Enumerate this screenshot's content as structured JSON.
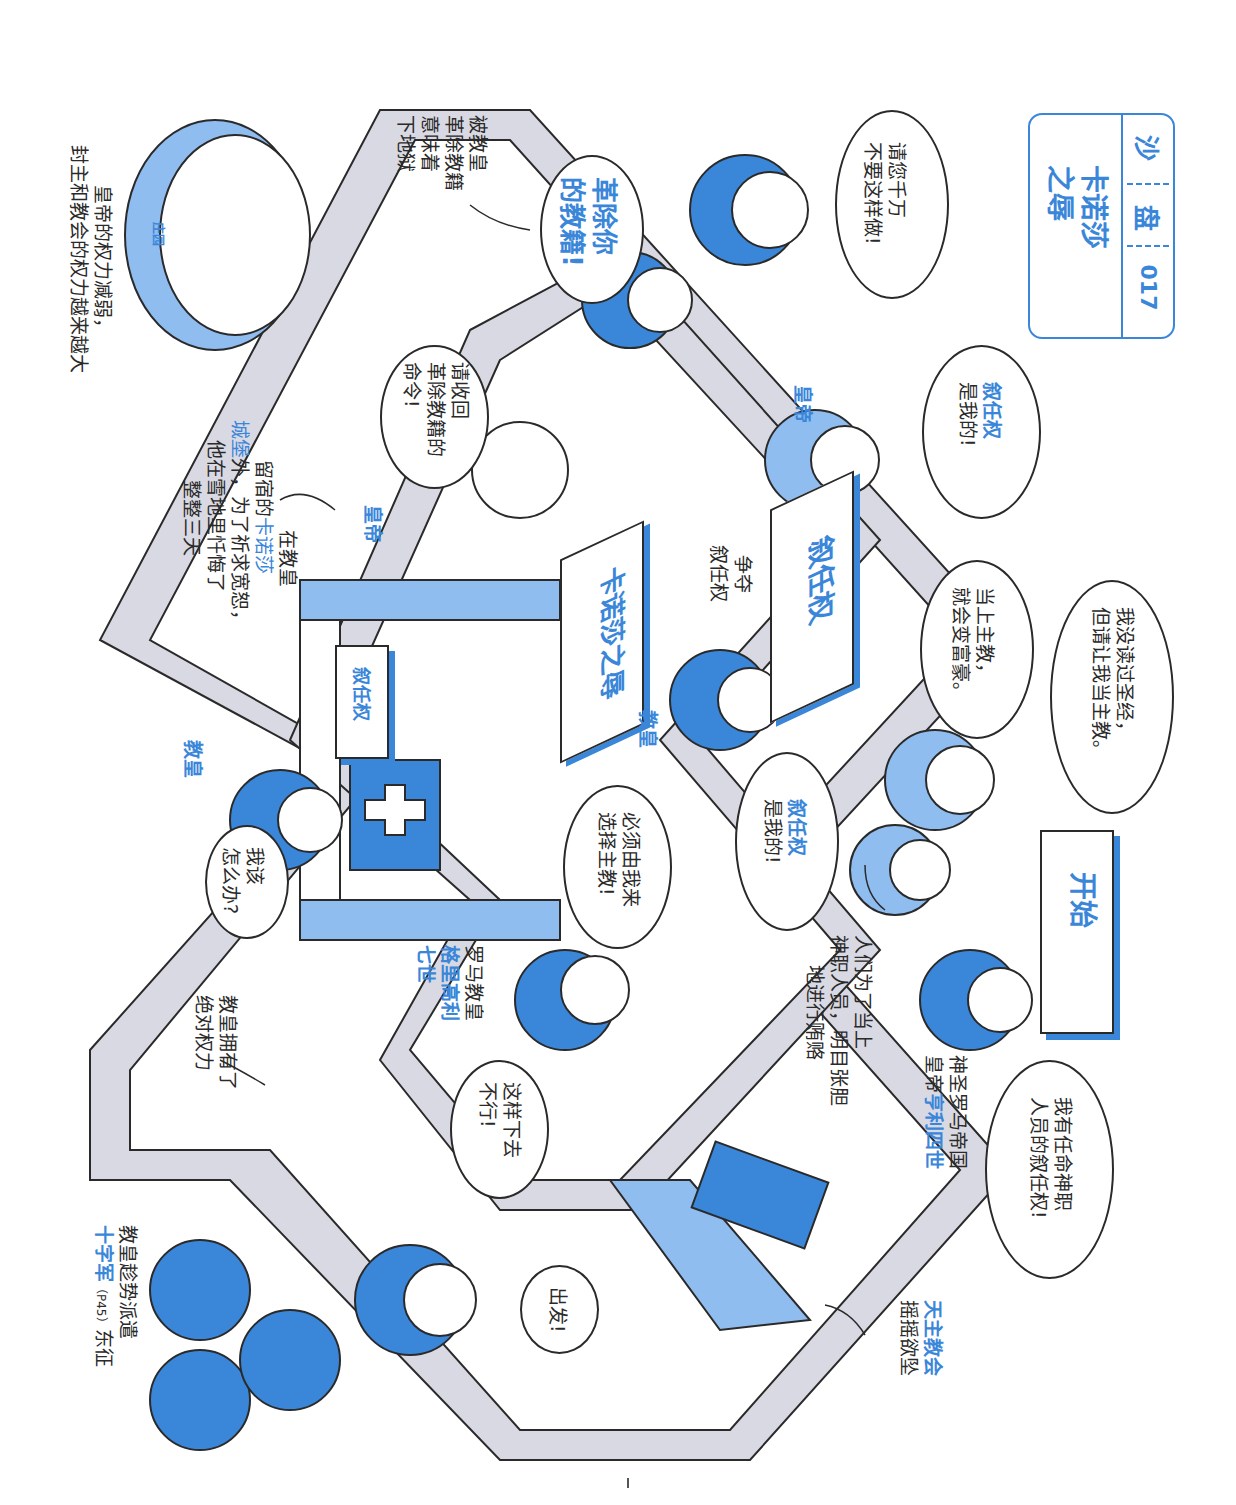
{
  "title_box": {
    "series_label_chars": [
      "沙",
      "盘",
      "017"
    ],
    "title_line1": "卡诺莎",
    "title_line2": "之辱"
  },
  "colors": {
    "accent_blue": "#3a86d9",
    "light_blue": "#8fbdf0",
    "path_gray": "#d9d9e3",
    "outline": "#2a2a2a"
  },
  "signs": {
    "start": "开始",
    "investiture_center": "叙任权",
    "canossa": "卡诺莎之辱",
    "investiture_castle": "叙任权",
    "manor": "庄园"
  },
  "speech_bubbles": {
    "dont_do_this": [
      "请您千万",
      "不要这样做!"
    ],
    "excommunicate": [
      "革除你",
      "的教籍!"
    ],
    "revoke_order": [
      "请收回",
      "革除教籍的",
      "命令!"
    ],
    "emperor_investiture": [
      "叙任权",
      "是我的!"
    ],
    "no_bible": [
      "我没读过圣经，",
      "但请让我当主教。"
    ],
    "become_rich": [
      "当上主教，",
      "就会变富豪。"
    ],
    "pope_investiture": [
      "叙任权",
      "是我的!"
    ],
    "must_choose": [
      "必须由我来",
      "选择主教!"
    ],
    "what_to_do": [
      "我该",
      "怎么办?"
    ],
    "cannot_continue": [
      "这样下去",
      "不行!"
    ],
    "depart": [
      "出发!"
    ],
    "appoint_clergy": [
      "我有任命神职",
      "人员的叙任权!"
    ]
  },
  "captions": {
    "excommunication_note": [
      "被教皇",
      "革除教籍",
      "意味着",
      "下地狱"
    ],
    "power_shift": [
      "皇帝的权力减弱，",
      "封主和教会的权力越来越大"
    ],
    "canossa_story": {
      "line1": "在教皇",
      "line2_prefix": "留宿的",
      "line2_highlight": "卡诺莎",
      "line3_highlight": "城堡",
      "line3_suffix": "外，为了祈求宽恕，",
      "line4": "他在雪地里忏悔了",
      "line5": "整整三天"
    },
    "fight_investiture": [
      "争夺",
      "叙任权"
    ],
    "bribery": [
      "人们为了当上",
      "神职人员，明目张胆",
      "地进行贿赂"
    ],
    "henry_iv": {
      "line1": "神圣罗马帝国",
      "line2_prefix": "皇帝",
      "line2_highlight": "亨利四世"
    },
    "gregory_vii": {
      "line1": "罗马教皇",
      "line2_highlight": "格里高利",
      "line3_highlight": "七世"
    },
    "absolute_power": [
      "教皇拥有了",
      "绝对权力"
    ],
    "crusade": {
      "line1": "教皇趁势派遣",
      "line2_highlight": "十字军",
      "line2_ref": "（P45）",
      "line2_suffix": "东征"
    },
    "church_shaking": {
      "line1_highlight": "天主教会",
      "line2": "摇摇欲坠"
    }
  },
  "labels": {
    "emperor_1": "皇帝",
    "emperor_2": "皇帝",
    "pope_1": "教皇",
    "pope_2": "教皇"
  }
}
